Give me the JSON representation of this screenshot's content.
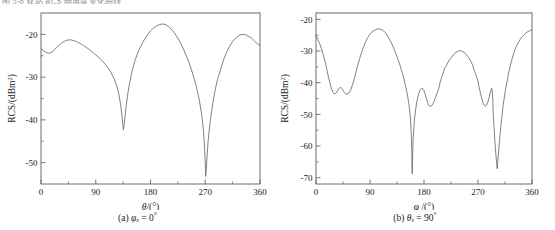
{
  "figure": {
    "clipped_header_text": "图 5-8 双站 RCS 随角度变化曲线",
    "background_color": "#ffffff",
    "curve_color": "#6a6a6a",
    "axis_color": "#5e5e5e"
  },
  "panels": [
    {
      "id": "a",
      "caption_prefix": "(a)",
      "caption_symbol": "φ",
      "caption_subscript": "s",
      "caption_equals": "=",
      "caption_value": "0",
      "caption_degree": "°",
      "xaxis_title_symbol": "θ",
      "xaxis_title_unit": "/(°)",
      "yaxis_title": "RCS/(dBm",
      "yaxis_title_sup": "2",
      "yaxis_title_tail": ")"
    },
    {
      "id": "b",
      "caption_prefix": "(b)",
      "caption_symbol": "θ",
      "caption_subscript": "s",
      "caption_equals": "=",
      "caption_value": "90",
      "caption_degree": "°",
      "xaxis_title_symbol": "φ",
      "xaxis_title_unit": " /(°)",
      "yaxis_title": "RCS/(dBm",
      "yaxis_title_sup": "2",
      "yaxis_title_tail": ")"
    }
  ],
  "chart_data": [
    {
      "type": "line",
      "panel": "a",
      "title": "(a) φs = 0°",
      "xlabel": "θ/(°)",
      "ylabel": "RCS/(dBm²)",
      "xlim": [
        0,
        360
      ],
      "ylim": [
        -55,
        -15
      ],
      "grid": false,
      "legend": null,
      "xticks": [
        0,
        90,
        180,
        270,
        360
      ],
      "xtick_labels": [
        "0",
        "90",
        "180",
        "270",
        "360"
      ],
      "xminor_ticks": [
        45,
        135,
        225,
        315
      ],
      "yticks": [
        -20,
        -30,
        -40,
        -50
      ],
      "ytick_labels": [
        "-20",
        "-30",
        "-40",
        "-50"
      ],
      "yminor_ticks": [
        -25,
        -35,
        -45
      ],
      "series": [
        {
          "name": "RCS",
          "x": [
            0,
            4,
            8,
            12,
            16,
            20,
            25,
            30,
            35,
            40,
            45,
            50,
            55,
            60,
            65,
            70,
            75,
            80,
            85,
            90,
            95,
            100,
            105,
            110,
            115,
            120,
            125,
            128,
            131,
            133,
            134.5,
            135.5,
            136.5,
            138,
            140,
            143,
            146,
            150,
            155,
            160,
            165,
            170,
            175,
            180,
            185,
            190,
            195,
            198,
            202,
            206,
            210,
            215,
            220,
            225,
            230,
            235,
            240,
            245,
            250,
            255,
            260,
            264,
            267,
            269,
            270,
            270.6,
            271.5,
            273,
            275,
            278,
            282,
            286,
            290,
            295,
            300,
            305,
            310,
            315,
            320,
            325,
            330,
            335,
            338,
            342,
            346,
            350,
            354,
            360
          ],
          "y": [
            -23.3,
            -23.8,
            -24.2,
            -24.4,
            -24.3,
            -23.9,
            -23.2,
            -22.5,
            -21.9,
            -21.5,
            -21.3,
            -21.3,
            -21.5,
            -21.8,
            -22.2,
            -22.6,
            -23.1,
            -23.6,
            -24.2,
            -24.8,
            -25.4,
            -26.1,
            -26.9,
            -27.8,
            -28.9,
            -30.3,
            -32.3,
            -34.0,
            -36.6,
            -39.0,
            -41.0,
            -42.3,
            -41.4,
            -39.4,
            -36.8,
            -33.6,
            -31.1,
            -28.4,
            -25.9,
            -24.0,
            -22.5,
            -21.2,
            -20.1,
            -19.2,
            -18.5,
            -18.0,
            -17.7,
            -17.6,
            -17.6,
            -17.8,
            -18.2,
            -18.9,
            -19.8,
            -20.9,
            -22.2,
            -23.7,
            -25.4,
            -27.3,
            -29.5,
            -32.0,
            -35.2,
            -38.6,
            -42.4,
            -46.6,
            -50.0,
            -53.2,
            -52.0,
            -48.5,
            -44.5,
            -40.5,
            -36.5,
            -33.2,
            -30.6,
            -28.3,
            -26.0,
            -24.2,
            -22.8,
            -21.7,
            -20.9,
            -20.3,
            -20.0,
            -20.0,
            -20.2,
            -20.5,
            -20.9,
            -21.4,
            -22.0,
            -22.6,
            -23.3
          ]
        }
      ]
    },
    {
      "type": "line",
      "panel": "b",
      "title": "(b) θs = 90°",
      "xlabel": "φ /(°)",
      "ylabel": "RCS/(dBm²)",
      "xlim": [
        0,
        360
      ],
      "ylim": [
        -72,
        -18
      ],
      "grid": false,
      "legend": null,
      "xticks": [
        0,
        90,
        180,
        270,
        360
      ],
      "xtick_labels": [
        "0",
        "90",
        "180",
        "270",
        "360"
      ],
      "xminor_ticks": [
        45,
        135,
        225,
        315
      ],
      "yticks": [
        -20,
        -30,
        -40,
        -50,
        -60,
        -70
      ],
      "ytick_labels": [
        "-20",
        "-30",
        "-40",
        "-50",
        "-60",
        "-70"
      ],
      "yminor_ticks": [
        -25,
        -35,
        -45,
        -55,
        -65
      ],
      "series": [
        {
          "name": "RCS",
          "x": [
            0,
            3,
            6,
            9,
            12,
            15,
            18,
            21,
            24,
            26,
            28,
            30,
            32,
            34,
            36,
            38,
            40,
            42,
            44,
            46,
            48,
            50,
            52,
            55,
            58,
            61,
            64,
            67,
            70,
            74,
            78,
            82,
            86,
            90,
            95,
            100,
            105,
            110,
            113,
            116,
            120,
            124,
            128,
            132,
            136,
            140,
            144,
            147,
            150,
            153,
            155,
            157,
            158,
            159,
            159.7,
            160.3,
            161,
            162,
            164,
            166,
            168,
            170,
            172,
            174,
            176,
            178,
            180,
            182,
            184,
            186,
            188,
            190,
            193,
            196,
            199,
            202,
            205,
            207,
            209,
            211,
            213,
            215,
            218,
            221,
            225,
            229,
            233,
            237,
            241,
            245,
            249,
            253,
            257,
            261,
            264,
            267,
            270,
            272,
            274,
            276,
            278,
            280,
            282,
            284,
            286,
            288,
            290,
            291.5,
            292.5,
            293.3,
            294,
            294.7,
            295.5,
            297,
            299,
            302,
            305,
            308,
            312,
            316,
            320,
            324,
            328,
            332,
            336,
            340,
            344,
            348,
            352,
            356,
            360
          ],
          "y": [
            -25.2,
            -26.3,
            -27.6,
            -29.2,
            -31.1,
            -33.3,
            -35.8,
            -38.4,
            -40.7,
            -42.0,
            -42.9,
            -43.4,
            -43.5,
            -43.2,
            -42.6,
            -41.9,
            -41.5,
            -41.6,
            -42.1,
            -42.8,
            -43.3,
            -43.6,
            -43.6,
            -43.2,
            -42.2,
            -40.6,
            -38.6,
            -36.4,
            -34.2,
            -31.6,
            -29.3,
            -27.4,
            -25.8,
            -24.7,
            -23.7,
            -23.2,
            -23.0,
            -23.3,
            -23.7,
            -24.3,
            -25.4,
            -26.8,
            -28.4,
            -30.3,
            -32.3,
            -34.5,
            -37.0,
            -39.2,
            -41.6,
            -44.6,
            -47.0,
            -50.5,
            -53.0,
            -57.0,
            -62.0,
            -68.8,
            -63.0,
            -57.5,
            -52.0,
            -48.5,
            -46.0,
            -44.3,
            -43.0,
            -42.2,
            -41.8,
            -41.9,
            -42.5,
            -43.6,
            -45.0,
            -46.3,
            -47.2,
            -47.5,
            -47.2,
            -46.2,
            -44.8,
            -43.2,
            -41.5,
            -39.8,
            -38.6,
            -37.4,
            -36.3,
            -35.3,
            -34.4,
            -33.2,
            -32.2,
            -31.2,
            -30.4,
            -30.0,
            -29.9,
            -30.2,
            -30.8,
            -31.7,
            -32.9,
            -34.4,
            -36.2,
            -37.8,
            -39.6,
            -41.6,
            -43.2,
            -44.8,
            -46.2,
            -47.1,
            -47.5,
            -47.2,
            -46.3,
            -45.0,
            -43.6,
            -42.4,
            -41.8,
            -41.9,
            -43.2,
            -46.0,
            -50.0,
            -55.0,
            -61.0,
            -67.2,
            -60.0,
            -54.0,
            -47.0,
            -42.0,
            -38.0,
            -34.5,
            -31.6,
            -29.4,
            -27.7,
            -26.4,
            -25.4,
            -24.6,
            -24.0,
            -23.6,
            -23.3,
            -23.2,
            -23.4,
            -23.8,
            -24.6
          ]
        }
      ]
    }
  ]
}
